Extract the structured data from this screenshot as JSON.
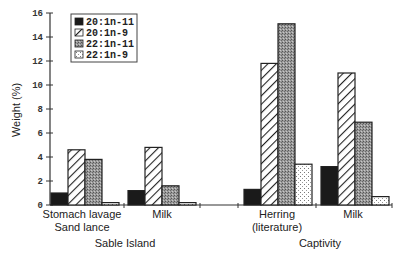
{
  "chart_data": {
    "type": "bar",
    "title": "",
    "xlabel": "",
    "ylabel": "Weight (%)",
    "ylim": [
      0,
      16
    ],
    "yticks": [
      0,
      2,
      4,
      6,
      8,
      10,
      12,
      14,
      16
    ],
    "grid": false,
    "legend_position": "upper-left-inside",
    "categories": [
      {
        "lines": [
          "Stomach lavage",
          "Sand lance"
        ],
        "group": "Sable Island"
      },
      {
        "lines": [
          "Milk"
        ],
        "group": "Sable Island"
      },
      {
        "lines": [
          "Herring",
          "(literature)"
        ],
        "group": "Captivity"
      },
      {
        "lines": [
          "Milk"
        ],
        "group": "Captivity"
      }
    ],
    "groups": [
      "Sable Island",
      "Captivity"
    ],
    "series": [
      {
        "name": "20:1n-11",
        "pattern": "solid-black",
        "values": [
          1.0,
          1.2,
          1.3,
          3.2
        ]
      },
      {
        "name": "20:1n-9",
        "pattern": "diagonal-hatch",
        "values": [
          4.6,
          4.8,
          11.8,
          11.0
        ]
      },
      {
        "name": "22:1n-11",
        "pattern": "grey-stipple",
        "values": [
          3.8,
          1.6,
          15.1,
          6.9
        ]
      },
      {
        "name": "22:1n-9",
        "pattern": "light-dotted",
        "values": [
          0.2,
          0.2,
          3.4,
          0.7
        ]
      }
    ]
  },
  "colors": {
    "solid": "#1a1a1a",
    "grey": "#8c8c8c",
    "axis": "#333333"
  }
}
